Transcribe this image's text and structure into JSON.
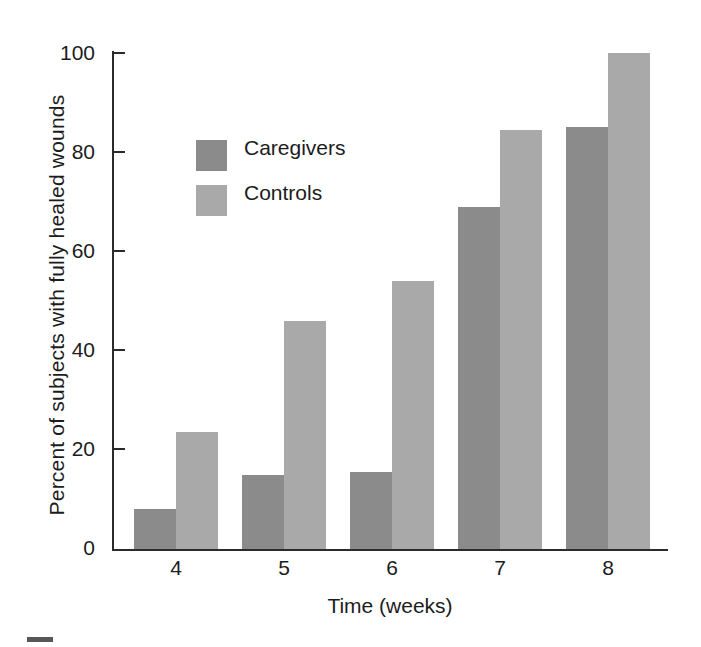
{
  "chart_data": {
    "type": "bar",
    "title": "",
    "subtitle": "",
    "xlabel": "Time (weeks)",
    "ylabel": "Percent of subjects with fully healed wounds",
    "categories": [
      "4",
      "5",
      "6",
      "7",
      "8"
    ],
    "series": [
      {
        "name": "Caregivers",
        "color": "#8b8b8b",
        "values": [
          8,
          15,
          15.5,
          69,
          85
        ]
      },
      {
        "name": "Controls",
        "color": "#a9a9a9",
        "values": [
          23.5,
          46,
          54,
          84.5,
          100
        ]
      }
    ],
    "ylim": [
      0,
      100
    ],
    "yticks": [
      0,
      20,
      40,
      60,
      80,
      100
    ],
    "ytick_labels": [
      "0",
      "20",
      "40",
      "60",
      "80",
      "100"
    ],
    "grid": false,
    "legend_position": "upper-left-inside",
    "axis_color": "#2b2b2b",
    "background": "#ffffff"
  },
  "axes": {
    "y_title": "Percent of subjects with fully healed wounds",
    "x_title": "Time (weeks)",
    "y_tick_labels": [
      "100",
      "80",
      "60",
      "40",
      "20",
      "0"
    ],
    "x_tick_labels": [
      "4",
      "5",
      "6",
      "7",
      "8"
    ]
  },
  "legend": {
    "items": [
      {
        "label": "Caregivers",
        "color": "#8b8b8b",
        "swatch": "legend-swatch-dark"
      },
      {
        "label": "Controls",
        "color": "#a9a9a9",
        "swatch": "legend-swatch-light"
      }
    ]
  }
}
